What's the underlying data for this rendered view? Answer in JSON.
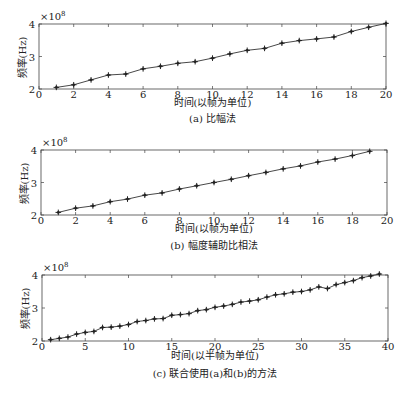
{
  "chart_data": [
    {
      "type": "line",
      "title": "(a) 比幅法",
      "xlabel": "时间(以帧为单位)",
      "ylabel": "频率(Hz)",
      "y_multiplier": "×10^8",
      "xlim": [
        0,
        20
      ],
      "ylim": [
        2,
        4
      ],
      "xticks": [
        0,
        2,
        4,
        6,
        8,
        10,
        12,
        14,
        16,
        18,
        20
      ],
      "yticks": [
        2,
        3,
        4
      ],
      "grid": false,
      "marker": "+",
      "x": [
        1,
        2,
        3,
        4,
        5,
        6,
        7,
        8,
        9,
        10,
        11,
        12,
        13,
        14,
        15,
        16,
        17,
        18,
        19,
        20
      ],
      "values": [
        2.05,
        2.13,
        2.28,
        2.43,
        2.46,
        2.62,
        2.7,
        2.79,
        2.84,
        2.95,
        3.08,
        3.19,
        3.25,
        3.41,
        3.49,
        3.54,
        3.6,
        3.77,
        3.9,
        4.02
      ]
    },
    {
      "type": "line",
      "title": "(b) 幅度辅助比相法",
      "xlabel": "时间(以帧为单位)",
      "ylabel": "频率(Hz)",
      "y_multiplier": "×10^8",
      "xlim": [
        0,
        20
      ],
      "ylim": [
        2,
        4
      ],
      "xticks": [
        0,
        2,
        4,
        6,
        8,
        10,
        12,
        14,
        16,
        18,
        20
      ],
      "yticks": [
        2,
        3,
        4
      ],
      "grid": false,
      "marker": "+",
      "x": [
        1,
        2,
        3,
        4,
        5,
        6,
        7,
        8,
        9,
        10,
        11,
        12,
        13,
        14,
        15,
        16,
        17,
        18,
        19
      ],
      "values": [
        2.08,
        2.21,
        2.28,
        2.41,
        2.49,
        2.61,
        2.68,
        2.8,
        2.9,
        3.0,
        3.1,
        3.21,
        3.31,
        3.42,
        3.51,
        3.63,
        3.72,
        3.83,
        3.96
      ]
    },
    {
      "type": "line",
      "title": "(c) 联合使用(a)和(b)的方法",
      "xlabel": "时间(以半帧为单位)",
      "ylabel": "频率(Hz)",
      "y_multiplier": "×10^8",
      "xlim": [
        0,
        40
      ],
      "ylim": [
        2,
        4
      ],
      "xticks": [
        0,
        5,
        10,
        15,
        20,
        25,
        30,
        35,
        40
      ],
      "yticks": [
        2,
        3,
        4
      ],
      "grid": false,
      "marker": "+",
      "x": [
        1,
        2,
        3,
        4,
        5,
        6,
        7,
        8,
        9,
        10,
        11,
        12,
        13,
        14,
        15,
        16,
        17,
        18,
        19,
        20,
        21,
        22,
        23,
        24,
        25,
        26,
        27,
        28,
        29,
        30,
        31,
        32,
        33,
        34,
        35,
        36,
        37,
        38,
        39
      ],
      "values": [
        2.04,
        2.08,
        2.12,
        2.21,
        2.26,
        2.29,
        2.41,
        2.42,
        2.45,
        2.5,
        2.59,
        2.62,
        2.67,
        2.68,
        2.78,
        2.8,
        2.83,
        2.92,
        2.95,
        3.02,
        3.06,
        3.11,
        3.18,
        3.21,
        3.25,
        3.33,
        3.4,
        3.43,
        3.48,
        3.5,
        3.55,
        3.64,
        3.59,
        3.71,
        3.77,
        3.83,
        3.92,
        3.97,
        4.03
      ]
    }
  ],
  "panels": [
    {
      "caption": "(a) 比幅法",
      "xlabel": "时间(以帧为单位)",
      "ylabel": "频率(Hz)",
      "exp_base": "×10",
      "exp_power": "8"
    },
    {
      "caption": "(b) 幅度辅助比相法",
      "xlabel": "时间(以帧为单位)",
      "ylabel": "频率(Hz)",
      "exp_base": "×10",
      "exp_power": "8"
    },
    {
      "caption": "(c) 联合使用(a)和(b)的方法",
      "xlabel": "时间(以半帧为单位)",
      "ylabel": "频率(Hz)",
      "exp_base": "×10",
      "exp_power": "8"
    }
  ],
  "layout": [
    {
      "left": 39,
      "top": 24,
      "right": 386,
      "bottom": 89,
      "xlabel_y": 100,
      "caption_y": 116
    },
    {
      "left": 41,
      "top": 150,
      "right": 387,
      "bottom": 215,
      "xlabel_y": 226,
      "caption_y": 243
    },
    {
      "left": 42,
      "top": 275,
      "right": 388,
      "bottom": 341,
      "xlabel_y": 353,
      "caption_y": 371
    }
  ],
  "colors": {
    "line": "#333333",
    "axis": "#444444",
    "marker": "#222222"
  }
}
